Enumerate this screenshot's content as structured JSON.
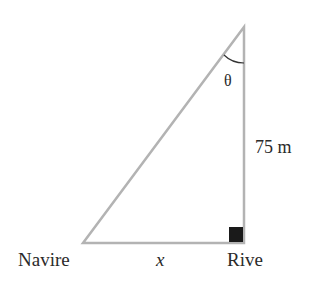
{
  "diagram": {
    "type": "right-triangle",
    "labels": {
      "left_vertex": "Navire",
      "right_vertex": "Rive",
      "base": "x",
      "height": "75 m",
      "angle": "θ"
    },
    "colors": {
      "lines": "#b3b3b3",
      "right_angle_marker": "#1a1a1a",
      "text": "#2a2a2a"
    }
  }
}
